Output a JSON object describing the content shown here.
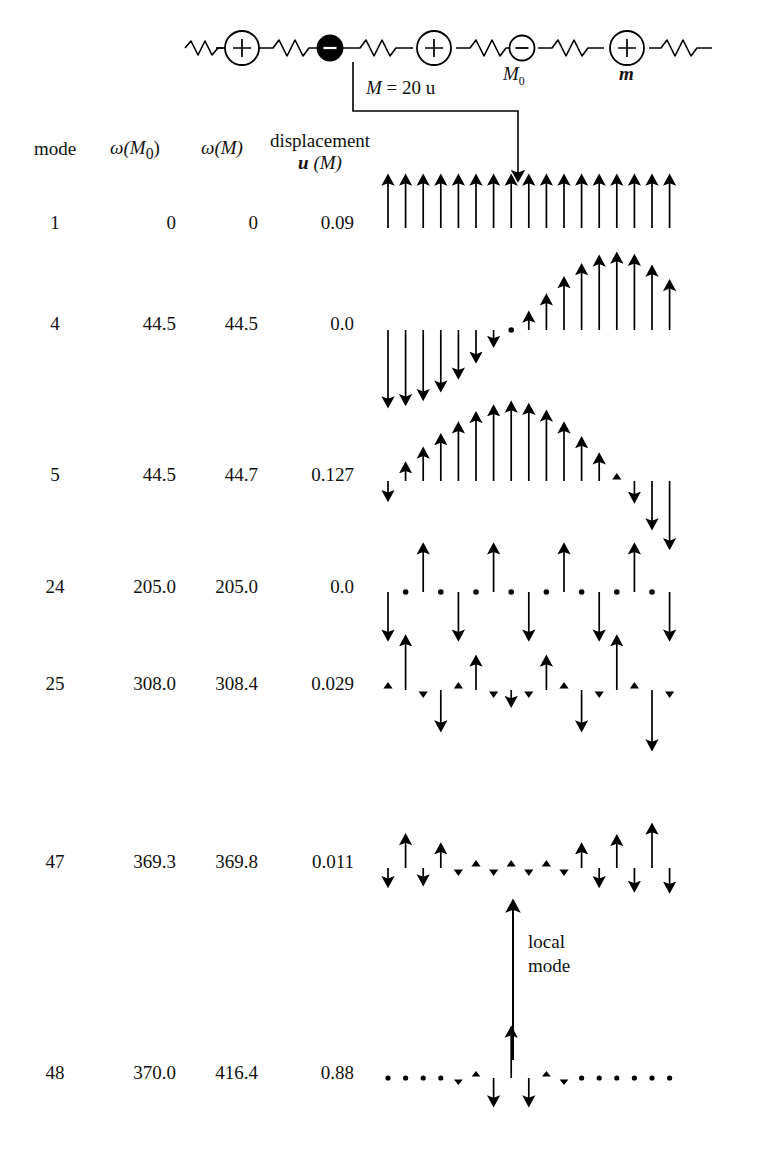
{
  "figure": {
    "chain": {
      "defect_label": "M = 20 u",
      "defect_label_italic": "M",
      "defect_label_rest": "= 20 u",
      "host_anion_label": "M",
      "host_anion_sub": "0",
      "host_cation_label": "m",
      "plus_sign": "+",
      "minus_sign": "−",
      "n_cells": 4
    },
    "headers": {
      "mode": "mode",
      "omega_M0": "ω(M₀)",
      "omega_M0_sym": "ω",
      "omega_M0_arg": "(M",
      "omega_M0_sub": "0",
      "omega_M0_close": ")",
      "omega_M": "ω(M)",
      "omega_M_sym": "ω",
      "omega_M_arg": "(M)",
      "displacement_line1": "displacement",
      "displacement_line2_u": "u",
      "displacement_line2_rest": "(M)"
    },
    "annotation": {
      "local_mode_line1": "local",
      "local_mode_line2": "mode"
    },
    "rows": [
      {
        "mode": "1",
        "omega_M0": "0",
        "omega_M": "0",
        "u": "0.09"
      },
      {
        "mode": "4",
        "omega_M0": "44.5",
        "omega_M": "44.5",
        "u": "0.0"
      },
      {
        "mode": "5",
        "omega_M0": "44.5",
        "omega_M": "44.7",
        "u": "0.127"
      },
      {
        "mode": "24",
        "omega_M0": "205.0",
        "omega_M": "205.0",
        "u": "0.0"
      },
      {
        "mode": "25",
        "omega_M0": "308.0",
        "omega_M": "308.4",
        "u": "0.029"
      },
      {
        "mode": "47",
        "omega_M0": "369.3",
        "omega_M": "369.8",
        "u": "0.011"
      },
      {
        "mode": "48",
        "omega_M0": "370.0",
        "omega_M": "416.4",
        "u": "0.88"
      }
    ]
  },
  "chart_data": {
    "type": "bar",
    "xlabel": "atom index along chain",
    "ylabel": "displacement u",
    "grid": false,
    "legend": null,
    "n_atoms": 17,
    "defect_index": 8,
    "series": [
      {
        "name": "mode 1",
        "omega": 0.0,
        "u_defect": 0.09,
        "values": [
          1.0,
          1.0,
          1.0,
          1.0,
          1.0,
          1.0,
          1.0,
          1.0,
          1.0,
          1.0,
          1.0,
          1.0,
          1.0,
          1.0,
          1.0,
          1.0,
          1.0
        ]
      },
      {
        "name": "mode 4",
        "omega": 44.5,
        "u_defect": 0.0,
        "values": [
          -1.0,
          -0.97,
          -0.9,
          -0.78,
          -0.6,
          -0.38,
          -0.16,
          0.0,
          0.18,
          0.42,
          0.66,
          0.84,
          0.96,
          1.0,
          0.97,
          0.82,
          0.62
        ]
      },
      {
        "name": "mode 5",
        "omega": 44.7,
        "u_defect": 0.127,
        "values": [
          -0.2,
          0.18,
          0.38,
          0.56,
          0.72,
          0.86,
          0.95,
          1.0,
          0.97,
          0.88,
          0.72,
          0.52,
          0.3,
          0.1,
          -0.22,
          -0.58,
          -0.85
        ]
      },
      {
        "name": "mode 24",
        "omega": 205.0,
        "u_defect": 0.0,
        "values": [
          -0.9,
          0.0,
          0.9,
          0.0,
          -0.9,
          0.0,
          0.9,
          0.0,
          -0.9,
          0.0,
          0.9,
          0.0,
          -0.9,
          0.0,
          0.9,
          0.0,
          -0.9
        ]
      },
      {
        "name": "mode 25",
        "omega": 308.4,
        "u_defect": 0.029,
        "values": [
          0.1,
          0.85,
          -0.12,
          -0.62,
          0.12,
          0.5,
          -0.12,
          -0.2,
          -0.12,
          0.5,
          0.12,
          -0.62,
          -0.12,
          0.85,
          0.1,
          -0.95,
          -0.12
        ]
      },
      {
        "name": "mode 47",
        "omega": 369.8,
        "u_defect": 0.011,
        "values": [
          -0.3,
          0.62,
          -0.26,
          0.42,
          -0.18,
          0.12,
          -0.1,
          0.08,
          -0.1,
          0.14,
          -0.2,
          0.42,
          -0.3,
          0.6,
          -0.4,
          0.85,
          -0.42
        ]
      },
      {
        "name": "mode 48",
        "omega": 416.4,
        "u_defect": 0.88,
        "values": [
          0.0,
          0.0,
          0.0,
          0.0,
          -0.06,
          0.16,
          -0.5,
          1.0,
          -0.5,
          0.16,
          -0.06,
          0.0,
          0.0,
          0.0,
          0.0,
          0.0,
          0.0
        ]
      }
    ]
  }
}
